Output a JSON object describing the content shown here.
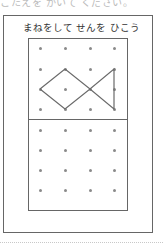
{
  "header": {
    "cut_text": "こたえを かいて ください。"
  },
  "worksheet": {
    "title": "まねをして せんを ひこう",
    "grid": {
      "columns": 4,
      "rows": 4
    },
    "top_grid_dots": {
      "x": [
        40,
        65,
        90,
        114
      ],
      "y": [
        48,
        69,
        89,
        109
      ]
    },
    "bottom_grid_dots": {
      "x": [
        40,
        65,
        90,
        114
      ],
      "y": [
        130,
        150,
        170,
        190
      ]
    },
    "model_figure": {
      "name": "fish",
      "points": "40,89 65,69 90,89 114,69 114,109 90,89 65,109 40,89",
      "stroke_color": "#6a6a6a"
    }
  }
}
